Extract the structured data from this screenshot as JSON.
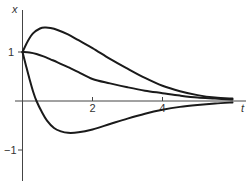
{
  "chart_data": {
    "type": "line",
    "title": "",
    "xlabel": "t",
    "ylabel": "x",
    "xlim": [
      0,
      6.3
    ],
    "ylim": [
      -1.6,
      1.85
    ],
    "grid": false,
    "legend": null,
    "x_ticks": [
      2,
      4
    ],
    "x_tick_labels": [
      "2",
      "4"
    ],
    "y_ticks": [
      1,
      -1
    ],
    "y_tick_labels": [
      "1",
      "−1"
    ],
    "series": [
      {
        "name": "upper",
        "x": [
          0,
          0.15,
          0.3,
          0.5,
          0.65,
          0.8,
          1.0,
          1.3,
          1.6,
          2.0,
          2.5,
          3.0,
          3.5,
          4.0,
          4.5,
          5.0,
          5.5,
          6.0
        ],
        "values": [
          1.0,
          1.22,
          1.38,
          1.48,
          1.5,
          1.49,
          1.45,
          1.36,
          1.24,
          1.08,
          0.86,
          0.66,
          0.47,
          0.31,
          0.2,
          0.12,
          0.07,
          0.05
        ]
      },
      {
        "name": "middle",
        "x": [
          0,
          0.2,
          0.4,
          0.6,
          0.8,
          1.0,
          1.3,
          1.6,
          2.0,
          2.5,
          3.0,
          3.5,
          4.0,
          4.5,
          5.0,
          5.5,
          6.0
        ],
        "values": [
          1.0,
          0.99,
          0.96,
          0.91,
          0.85,
          0.79,
          0.69,
          0.59,
          0.45,
          0.36,
          0.28,
          0.21,
          0.16,
          0.11,
          0.07,
          0.05,
          0.03
        ]
      },
      {
        "name": "lower",
        "x": [
          0,
          0.1,
          0.2,
          0.3,
          0.4,
          0.55,
          0.7,
          0.9,
          1.1,
          1.3,
          1.6,
          2.0,
          2.5,
          3.0,
          3.5,
          4.0,
          4.5,
          5.0,
          5.5,
          6.0
        ],
        "values": [
          1.0,
          0.72,
          0.45,
          0.2,
          0.0,
          -0.22,
          -0.4,
          -0.55,
          -0.62,
          -0.65,
          -0.64,
          -0.58,
          -0.47,
          -0.36,
          -0.26,
          -0.18,
          -0.12,
          -0.08,
          -0.05,
          -0.03
        ]
      }
    ]
  },
  "labels": {
    "x_axis": "t",
    "y_axis": "x",
    "tick_2": "2",
    "tick_4": "4",
    "tick_1": "1",
    "tick_m1": "−1"
  },
  "style": {
    "curve_color": "#1a1a1a",
    "axis_color": "#444444"
  }
}
